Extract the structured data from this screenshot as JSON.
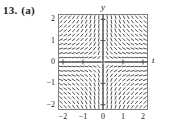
{
  "figure": {
    "problem_number": "13.",
    "part_label": "(a)"
  },
  "chart_data": {
    "type": "scatter",
    "subtype": "slope-field",
    "title": "",
    "xlabel": "t",
    "ylabel": "y",
    "xlim": [
      -2.25,
      2.25
    ],
    "ylim": [
      -2.25,
      2.25
    ],
    "xticks": [
      -2,
      -1,
      0,
      1,
      2
    ],
    "xtick_labels": [
      "−2",
      "−1",
      "0",
      "1",
      "2"
    ],
    "yticks": [
      2,
      1,
      0,
      -1,
      -2
    ],
    "ytick_labels": [
      "2",
      "1",
      "0",
      "−1",
      "−2"
    ],
    "grid": false,
    "legend": false,
    "axis_line_color": "#4a4a4a",
    "frame_color": "#7d7d7d",
    "segment_color": "#3c3c3c",
    "grid_nx": 21,
    "grid_ny": 21,
    "slope_formula": "dy/dt = -y/t"
  }
}
